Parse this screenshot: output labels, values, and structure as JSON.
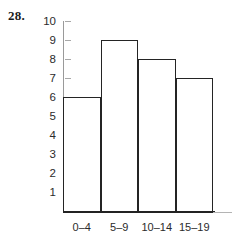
{
  "figure": {
    "problem_number": "28."
  },
  "chart_data": {
    "type": "bar",
    "title": "",
    "subtitle": "",
    "xlabel": "",
    "ylabel": "",
    "categories": [
      "0–4",
      "5–9",
      "10–14",
      "15–19"
    ],
    "values": [
      6,
      9,
      8,
      7
    ],
    "ylim": [
      0,
      10
    ],
    "y_ticks": [
      10,
      9,
      8,
      7,
      6,
      5,
      4,
      3,
      2,
      1
    ],
    "y_tick_labels": [
      "10",
      "9",
      "8",
      "7",
      "6",
      "5",
      "4",
      "3",
      "2",
      "1"
    ],
    "grid": false,
    "legend": null,
    "bar_fill_color": "#ffffff",
    "bar_edge_color": "#242424",
    "axis_color": "#2b2b2b",
    "text_color": "#2b2b2b",
    "background_color": "#ffffff"
  }
}
